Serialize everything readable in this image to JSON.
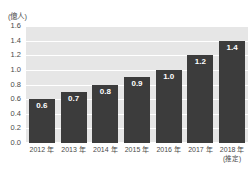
{
  "chart_data": {
    "type": "bar",
    "title": "",
    "subtitle": "",
    "unit_label": "(億人)",
    "xlabel": "",
    "ylabel": "",
    "ylim": [
      0.0,
      1.6
    ],
    "y_ticks": [
      "0.0",
      "0.2",
      "0.4",
      "0.6",
      "0.8",
      "1.0",
      "1.2",
      "1.4",
      "1.6"
    ],
    "y_tick_values": [
      0.0,
      0.2,
      0.4,
      0.6,
      0.8,
      1.0,
      1.2,
      1.4,
      1.6
    ],
    "grid": true,
    "grid_orientation": "horizontal",
    "legend": "none",
    "categories": [
      "2012 年",
      "2013 年",
      "2014 年",
      "2015 年",
      "2016 年",
      "2017 年",
      "2018 年"
    ],
    "category_sublabels": [
      "",
      "",
      "",
      "",
      "",
      "",
      "(推定)"
    ],
    "values": [
      0.6,
      0.7,
      0.8,
      0.9,
      1.0,
      1.2,
      1.4
    ],
    "value_labels": [
      "0.6",
      "0.7",
      "0.8",
      "0.9",
      "1.0",
      "1.2",
      "1.4"
    ],
    "colors": {
      "bar": "#3c3c3c",
      "plot_background": "#e6e6e6",
      "gridline": "#ffffff",
      "value_label": "#ffffff",
      "axis_text": "#4a4a4a",
      "page_background": "#ffffff"
    }
  }
}
